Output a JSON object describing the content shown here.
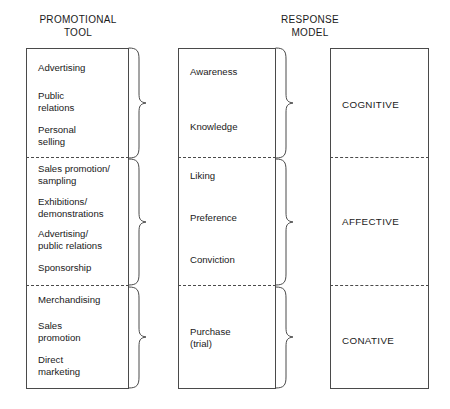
{
  "diagram": {
    "columns": [
      {
        "id": "promotional-tool",
        "header": "PROMOTIONAL\nTOOL",
        "groups": [
          {
            "id": "cognitive-tools",
            "items": [
              {
                "label": "Advertising",
                "top": 62
              },
              {
                "label": "Public\nrelations",
                "top": 90
              },
              {
                "label": "Personal\nselling",
                "top": 124
              }
            ]
          },
          {
            "id": "affective-tools",
            "items": [
              {
                "label": "Sales promotion/\nsampling",
                "top": 163
              },
              {
                "label": "Exhibitions/\ndemonstrations",
                "top": 196
              },
              {
                "label": "Advertising/\npublic relations",
                "top": 228
              },
              {
                "label": "Sponsorship",
                "top": 262
              }
            ]
          },
          {
            "id": "conative-tools",
            "items": [
              {
                "label": "Merchandising",
                "top": 294
              },
              {
                "label": "Sales\npromotion",
                "top": 320
              },
              {
                "label": "Direct\nmarketing",
                "top": 354
              }
            ]
          }
        ]
      },
      {
        "id": "response-model",
        "header": "RESPONSE\nMODEL",
        "groups": [
          {
            "id": "cognitive-stages",
            "items": [
              {
                "label": "Awareness",
                "top": 66
              },
              {
                "label": "Knowledge",
                "top": 121
              }
            ]
          },
          {
            "id": "affective-stages",
            "items": [
              {
                "label": "Liking",
                "top": 170
              },
              {
                "label": "Preference",
                "top": 212
              },
              {
                "label": "Conviction",
                "top": 254
              }
            ]
          },
          {
            "id": "conative-stages",
            "items": [
              {
                "label": "Purchase\n(trial)",
                "top": 326
              }
            ]
          }
        ]
      },
      {
        "id": "response-type",
        "header": "",
        "groups": [
          {
            "id": "cognitive-type",
            "items": [
              {
                "label": "COGNITIVE",
                "top": 99
              }
            ]
          },
          {
            "id": "affective-type",
            "items": [
              {
                "label": "AFFECTIVE",
                "top": 216
              }
            ]
          },
          {
            "id": "conative-type",
            "items": [
              {
                "label": "CONATIVE",
                "top": 335
              }
            ]
          }
        ]
      }
    ],
    "dividers": [
      {
        "row": 1,
        "top": 157
      },
      {
        "row": 2,
        "top": 285
      }
    ],
    "style": {
      "border_color": "#4a4a4a",
      "text_color": "#1a1a1a",
      "background": "#ffffff",
      "brace_color": "#4a4a4a"
    }
  }
}
